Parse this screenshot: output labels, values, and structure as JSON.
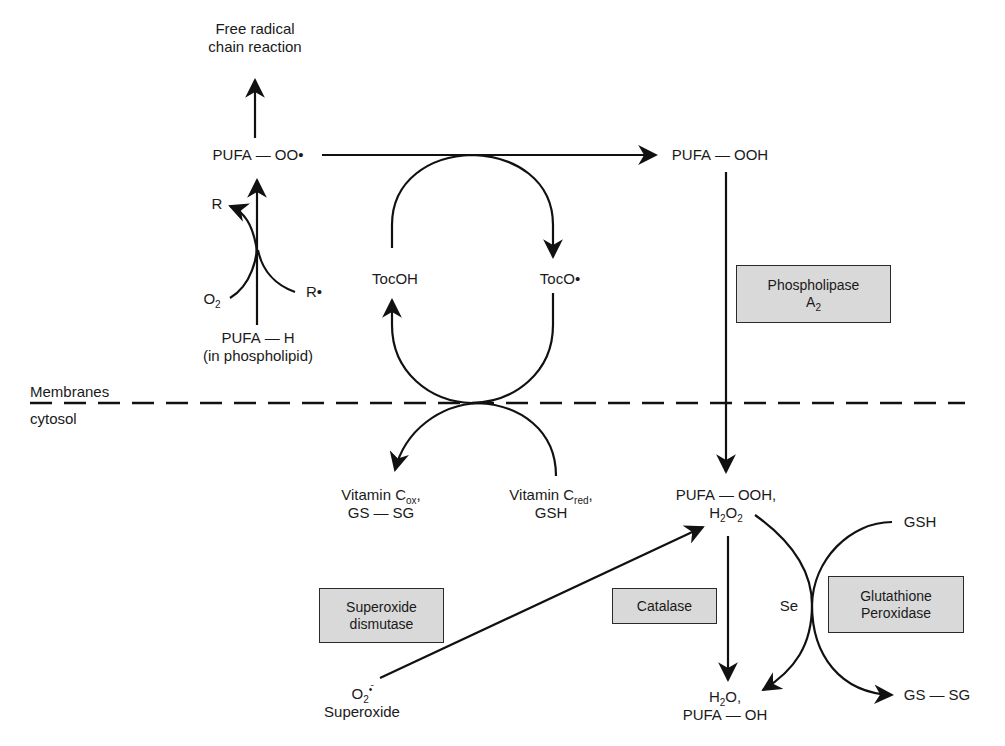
{
  "diagram": {
    "top": {
      "free_radical_line1": "Free radical",
      "free_radical_line2": "chain reaction",
      "pufa_oo_left": "PUFA",
      "pufa_oo_right": "OO•",
      "pufa_ooh_left": "PUFA",
      "pufa_ooh_right": "OOH"
    },
    "initiation": {
      "r_product": "R",
      "o2_base": "O",
      "o2_sub": "2",
      "r_radical": "R•",
      "pufa_h_left": "PUFA",
      "pufa_h_right": "H",
      "pufa_h_note": "(in phospholipid)"
    },
    "tocopherol": {
      "tocoh": "TocOH",
      "toco_radical": "TocO•"
    },
    "compartments": {
      "membranes": "Membranes",
      "cytosol": "cytosol"
    },
    "vitamin_c": {
      "ox_base": "Vitamin C",
      "ox_sub": "ox",
      "ox_suffix": ",",
      "ox_line2_left": "GS",
      "ox_line2_right": "SG",
      "red_base": "Vitamin C",
      "red_sub": "red",
      "red_suffix": ",",
      "red_line2": "GSH"
    },
    "peroxides": {
      "line1_left": "PUFA",
      "line1_right": "OOH,",
      "h2o2_h": "H",
      "h2o2_sub1": "2",
      "h2o2_o": "O",
      "h2o2_sub2": "2"
    },
    "products": {
      "h2o_h": "H",
      "h2o_sub": "2",
      "h2o_o": "O,",
      "line2_left": "PUFA",
      "line2_right": "OH"
    },
    "glutathione": {
      "gsh": "GSH",
      "gssg_left": "GS",
      "gssg_right": "SG",
      "se": "Se"
    },
    "superoxide": {
      "o2_base": "O",
      "o2_sup": "•̄",
      "o2_sub": "2",
      "label": "Superoxide"
    },
    "enzymes": {
      "phospholipase_line1": "Phospholipase",
      "phospholipase_a": "A",
      "phospholipase_sub": "2",
      "catalase": "Catalase",
      "sod_line1": "Superoxide",
      "sod_line2": "dismutase",
      "gpx_line1": "Glutathione",
      "gpx_line2": "Peroxidase"
    },
    "bond_dash": "—",
    "colors": {
      "line": "#111111",
      "enzyme_box_fill": "#d9d9d9",
      "enzyme_box_border": "#2a2a2a",
      "background": "#ffffff"
    }
  }
}
